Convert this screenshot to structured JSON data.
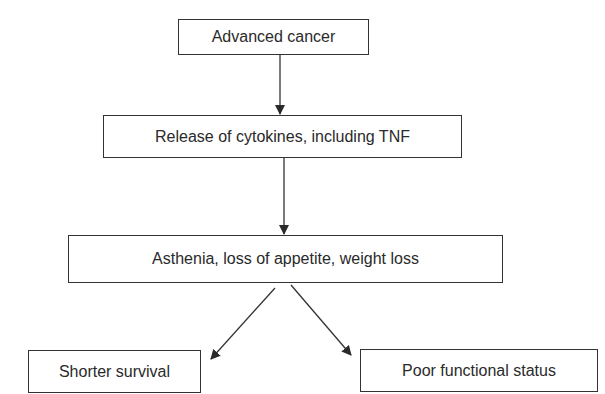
{
  "diagram": {
    "type": "flowchart",
    "nodes": [
      {
        "id": "n1",
        "label": "Advanced cancer"
      },
      {
        "id": "n2",
        "label": "Release of cytokines, including TNF"
      },
      {
        "id": "n3",
        "label": "Asthenia, loss of appetite, weight loss"
      },
      {
        "id": "n4",
        "label": "Shorter survival"
      },
      {
        "id": "n5",
        "label": "Poor functional status"
      }
    ],
    "edges": [
      {
        "from": "n1",
        "to": "n2"
      },
      {
        "from": "n2",
        "to": "n3"
      },
      {
        "from": "n3",
        "to": "n4"
      },
      {
        "from": "n3",
        "to": "n5"
      }
    ]
  }
}
